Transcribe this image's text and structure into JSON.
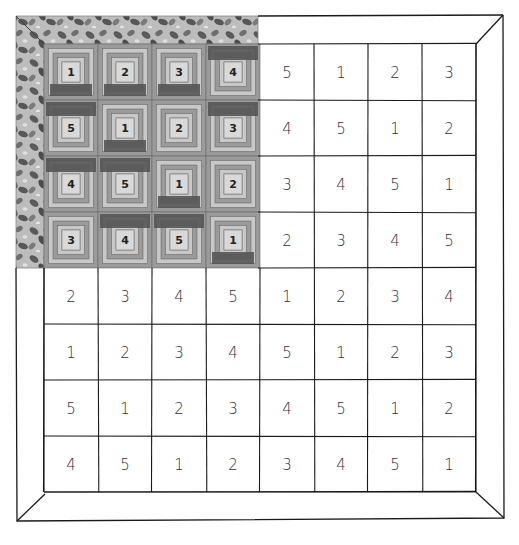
{
  "figure": {
    "colors": {
      "line": "#1a1a1a",
      "background": "#ffffff",
      "block_light": "#c8c8c8",
      "block_mid": "#9a9a9a",
      "block_dark": "#555555",
      "center_light": "#d9d9d9",
      "leaf_dark": "#5a5a5a",
      "leaf_light": "#bdbdbd"
    },
    "grid": {
      "rows": 8,
      "cols": 8,
      "values": [
        [
          1,
          2,
          3,
          4,
          5,
          1,
          2,
          3
        ],
        [
          5,
          1,
          2,
          3,
          4,
          5,
          1,
          2
        ],
        [
          4,
          5,
          1,
          2,
          3,
          4,
          5,
          1
        ],
        [
          3,
          4,
          5,
          1,
          2,
          3,
          4,
          5
        ],
        [
          2,
          3,
          4,
          5,
          1,
          2,
          3,
          4
        ],
        [
          1,
          2,
          3,
          4,
          5,
          1,
          2,
          3
        ],
        [
          5,
          1,
          2,
          3,
          4,
          5,
          1,
          2
        ],
        [
          4,
          5,
          1,
          2,
          3,
          4,
          5,
          1
        ]
      ],
      "quilted_region": {
        "rows": [
          0,
          3
        ],
        "cols": [
          0,
          3
        ]
      },
      "dark_strip_position": [
        [
          "bottom",
          "bottom",
          "bottom",
          "top"
        ],
        [
          "top",
          "bottom",
          "none",
          "top"
        ],
        [
          "top",
          "top",
          "bottom",
          "none"
        ],
        [
          "none",
          "top",
          "top",
          "bottom"
        ]
      ]
    }
  }
}
